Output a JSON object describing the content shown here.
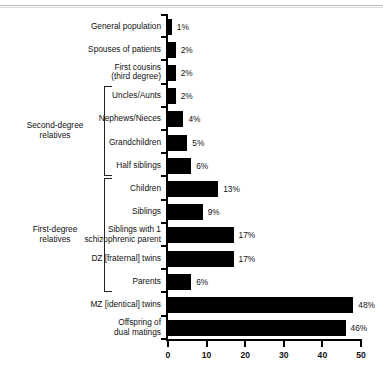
{
  "chart_data": {
    "type": "bar",
    "orientation": "horizontal",
    "title": "",
    "xlabel": "",
    "ylabel": "",
    "xlim": [
      0,
      50
    ],
    "xticks": [
      0,
      10,
      20,
      30,
      40,
      50
    ],
    "xtick_labels": [
      "0",
      "10",
      "20",
      "30",
      "40",
      "50"
    ],
    "grid": false,
    "legend": null,
    "bar_color": "#000000",
    "background_color": "#ffffff",
    "categories": [
      "General population",
      "Spouses of patients",
      "First cousins\n(third degree)",
      "Uncles/Aunts",
      "Nephews/Nieces",
      "Grandchildren",
      "Half siblings",
      "Children",
      "Siblings",
      "Siblings with 1\nschizophrenic parent",
      "DZ [fraternal] twins",
      "Parents",
      "MZ [identical] twins",
      "Offspring of\ndual matings"
    ],
    "values": [
      1,
      2,
      2,
      2,
      4,
      5,
      6,
      13,
      9,
      17,
      17,
      6,
      48,
      46
    ],
    "value_labels": [
      "1%",
      "2%",
      "2%",
      "2%",
      "4%",
      "5%",
      "6%",
      "13%",
      "9%",
      "17%",
      "17%",
      "6%",
      "48%",
      "46%"
    ],
    "groups": [
      {
        "label": "Second-degree\nrelatives",
        "first_index": 3,
        "last_index": 6
      },
      {
        "label": "First-degree\nrelatives",
        "first_index": 7,
        "last_index": 11
      }
    ]
  }
}
